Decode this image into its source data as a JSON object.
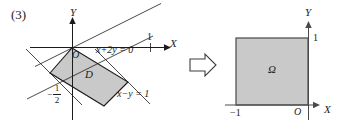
{
  "figure": {
    "problem_number": "(3)",
    "left_diagram": {
      "name": "region-D-parallelogram",
      "axis_y_label": "Y",
      "axis_x_label": "X",
      "origin_label": "O",
      "region_label": "D",
      "x_tick_label": "1",
      "y_tick_minus_half": {
        "minus": "−",
        "numerator": "1",
        "denominator": "2"
      },
      "line_label_1": "x+2y = 0",
      "line_label_2": "x−y = 1",
      "fill_color": "#c9c9c9",
      "stroke_color": "#1b1b1b"
    },
    "arrow": {
      "name": "maps-to-arrow",
      "glyph": "⇒"
    },
    "right_diagram": {
      "name": "region-omega-square",
      "axis_y_label": "Y",
      "axis_x_label": "X",
      "origin_label": "O",
      "region_label": "Ω",
      "y_tick_label": "1",
      "x_tick_label": "−1",
      "fill_color": "#c9c9c9",
      "stroke_color": "#555555"
    }
  }
}
